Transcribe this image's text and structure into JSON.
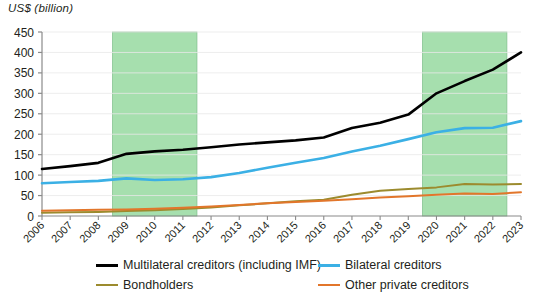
{
  "chart_data": {
    "type": "line",
    "title": "US$ (billion)",
    "ylabel": "US$ (billion)",
    "xlabel": "",
    "ylim": [
      0,
      450
    ],
    "ytick_step": 50,
    "yticks": [
      0,
      50,
      100,
      150,
      200,
      250,
      300,
      350,
      400,
      450
    ],
    "grid": true,
    "legend_position": "bottom",
    "x": [
      2006,
      2007,
      2008,
      2009,
      2010,
      2011,
      2012,
      2013,
      2014,
      2015,
      2016,
      2017,
      2018,
      2019,
      2020,
      2021,
      2022,
      2023
    ],
    "categories": [
      "2006",
      "2007",
      "2008",
      "2009",
      "2010",
      "2011",
      "2012",
      "2013",
      "2014",
      "2015",
      "2016",
      "2017",
      "2018",
      "2019",
      "2020",
      "2021",
      "2022",
      "2023"
    ],
    "series": [
      {
        "name": "Multilateral creditors (including IMF)",
        "color": "#000000",
        "values": [
          115,
          122,
          130,
          152,
          158,
          162,
          168,
          175,
          180,
          185,
          192,
          215,
          228,
          248,
          300,
          330,
          358,
          400
        ]
      },
      {
        "name": "Bilateral creditors",
        "color": "#3bb0e5",
        "values": [
          80,
          83,
          86,
          92,
          88,
          90,
          95,
          105,
          118,
          130,
          142,
          158,
          172,
          188,
          205,
          215,
          216,
          232
        ]
      },
      {
        "name": "Bondholders",
        "color": "#9c8b2e",
        "values": [
          8,
          9,
          10,
          12,
          14,
          17,
          21,
          26,
          31,
          36,
          40,
          52,
          62,
          66,
          70,
          78,
          77,
          78
        ]
      },
      {
        "name": "Other private creditors",
        "color": "#e2762b",
        "values": [
          13,
          14,
          15,
          16,
          18,
          20,
          23,
          27,
          31,
          34,
          37,
          41,
          45,
          48,
          52,
          55,
          54,
          58
        ]
      }
    ],
    "shaded_bands": [
      {
        "name": "band-2009-2011",
        "x_start": 2008.5,
        "x_end": 2011.5,
        "color": "#a6dfae"
      },
      {
        "name": "band-2020-2022",
        "x_start": 2019.5,
        "x_end": 2022.5,
        "color": "#a6dfae"
      }
    ]
  },
  "legend": {
    "items": [
      {
        "label": "Multilateral creditors (including IMF)",
        "color": "#000000",
        "thickness": 3
      },
      {
        "label": "Bilateral creditors",
        "color": "#3bb0e5",
        "thickness": 3
      },
      {
        "label": "Bondholders",
        "color": "#9c8b2e",
        "thickness": 2
      },
      {
        "label": "Other private creditors",
        "color": "#e2762b",
        "thickness": 2
      }
    ]
  }
}
